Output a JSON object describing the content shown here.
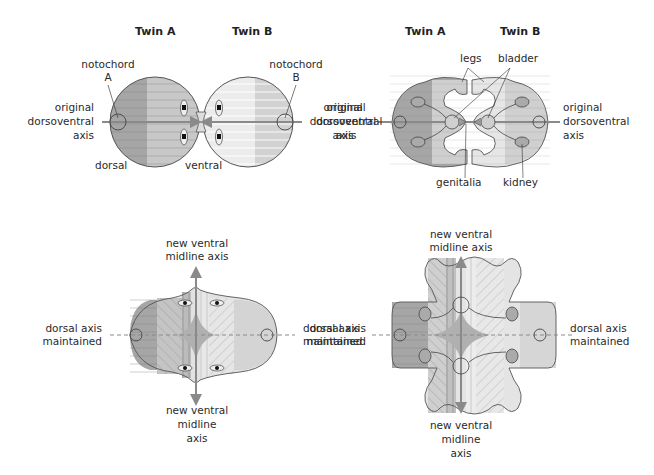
{
  "panels": {
    "top_left": {
      "twin_a": "Twin A",
      "twin_b": "Twin B",
      "notochord_a": [
        "notochord",
        "A"
      ],
      "notochord_b": [
        "notochord",
        "B"
      ],
      "axis_left": [
        "original",
        "dorsoventral",
        "axis"
      ],
      "axis_right": [
        "original",
        "dorsoventral",
        "axis"
      ],
      "dorsal": "dorsal",
      "ventral": "ventral"
    },
    "top_right": {
      "twin_a": "Twin A",
      "twin_b": "Twin B",
      "legs": "legs",
      "bladder": "bladder",
      "genitalia": "genitalia",
      "kidney": "kidney",
      "axis_left": [
        "original",
        "dorsoventral",
        "axis"
      ],
      "axis_right": [
        "original",
        "dorsoventral",
        "axis"
      ]
    },
    "bottom_left": {
      "top_axis": [
        "new ventral",
        "midline axis"
      ],
      "bottom_axis": [
        "new ventral",
        "midline",
        "axis"
      ],
      "left_axis": [
        "dorsal axis",
        "maintained"
      ],
      "right_axis": [
        "dorsal axis",
        "maintained"
      ]
    },
    "bottom_right": {
      "top_axis": [
        "new ventral",
        "midline axis"
      ],
      "bottom_axis": [
        "new ventral",
        "midline",
        "axis"
      ],
      "left_axis": [
        "dorsal axis",
        "maintained"
      ],
      "right_axis": [
        "dorsal axis",
        "maintained"
      ]
    }
  },
  "colors": {
    "dark_fill": "#a6a6a6",
    "mid_fill": "#c9c9c9",
    "light_fill": "#e6e6e6",
    "outline": "#555555",
    "axis": "#8a8a8a"
  }
}
